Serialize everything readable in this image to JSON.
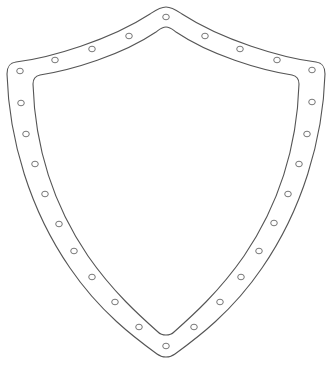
{
  "image": {
    "subject": "shield outline with rivets",
    "background": "#ffffff",
    "stroke_color": "#555555",
    "rivet_stroke_color": "#777777"
  },
  "shield": {
    "outer_path": "M 166 7 C 160 7 156 10 150 14 C 110 40 50 58 16 62 C 9 63 7 67 7 74 C 9 140 30 210 70 268 C 100 312 135 338 157 354 C 162 358 170 358 175 354 C 197 338 232 312 262 268 C 302 210 323 140 325 74 C 325 67 323 63 316 62 C 282 58 222 40 182 14 C 176 10 172 7 166 7 Z",
    "inner_path": "M 166 27 C 162 27 160 29 156 32 C 122 55 72 70 40 75 C 35 76 33 79 33 84 C 35 148 54 206 88 256 C 113 292 140 316 158 332 C 162 336 170 336 174 332 C 192 316 219 292 244 256 C 278 206 297 148 299 84 C 299 79 297 76 292 75 C 260 70 210 55 176 32 C 172 29 170 27 166 27 Z"
  },
  "rivets": [
    {
      "x": 166,
      "y": 17
    },
    {
      "x": 129,
      "y": 36
    },
    {
      "x": 92,
      "y": 49
    },
    {
      "x": 55,
      "y": 60
    },
    {
      "x": 20,
      "y": 71
    },
    {
      "x": 21,
      "y": 103
    },
    {
      "x": 26,
      "y": 134
    },
    {
      "x": 35,
      "y": 164
    },
    {
      "x": 45,
      "y": 194
    },
    {
      "x": 59,
      "y": 224
    },
    {
      "x": 74,
      "y": 251
    },
    {
      "x": 92,
      "y": 277
    },
    {
      "x": 115,
      "y": 302
    },
    {
      "x": 139,
      "y": 327
    },
    {
      "x": 166,
      "y": 346
    },
    {
      "x": 194,
      "y": 327
    },
    {
      "x": 220,
      "y": 302
    },
    {
      "x": 241,
      "y": 277
    },
    {
      "x": 259,
      "y": 251
    },
    {
      "x": 274,
      "y": 223
    },
    {
      "x": 288,
      "y": 194
    },
    {
      "x": 299,
      "y": 164
    },
    {
      "x": 307,
      "y": 134
    },
    {
      "x": 312,
      "y": 102
    },
    {
      "x": 312,
      "y": 70
    },
    {
      "x": 277,
      "y": 60
    },
    {
      "x": 240,
      "y": 49
    },
    {
      "x": 205,
      "y": 36
    }
  ]
}
